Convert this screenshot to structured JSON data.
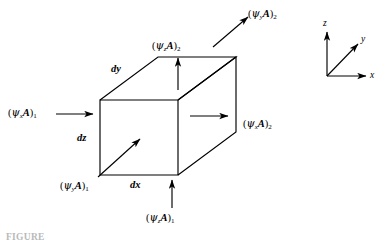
{
  "figure": {
    "type": "control-volume-flux-diagram",
    "caption": "FIGURE",
    "box": {
      "edge_labels": {
        "dx": "dx",
        "dy": "dy",
        "dz": "dz"
      }
    },
    "axes": {
      "x": "x",
      "y": "y",
      "z": "z"
    },
    "fluxes": {
      "x_in": {
        "open": "(",
        "psi": "ψ",
        "sub": "x",
        "area": "A",
        "close": ")",
        "index": "1"
      },
      "x_out": {
        "open": "(",
        "psi": "ψ",
        "sub": "x",
        "area": "A",
        "close": ")",
        "index": "2"
      },
      "y_in": {
        "open": "(",
        "psi": "ψ",
        "sub": "y",
        "area": "A",
        "close": ")",
        "index": "1"
      },
      "y_out": {
        "open": "(",
        "psi": "ψ",
        "sub": "y",
        "area": "A",
        "close": ")",
        "index": "2"
      },
      "z_in": {
        "open": "(",
        "psi": "ψ",
        "sub": "z",
        "area": "A",
        "close": ")",
        "index": "1"
      },
      "z_out": {
        "open": "(",
        "psi": "ψ",
        "sub": "z",
        "area": "A",
        "close": ")",
        "index": "2"
      }
    },
    "colors": {
      "ink": "#000000",
      "background": "#ffffff",
      "caption": "#b9b9b9"
    }
  }
}
